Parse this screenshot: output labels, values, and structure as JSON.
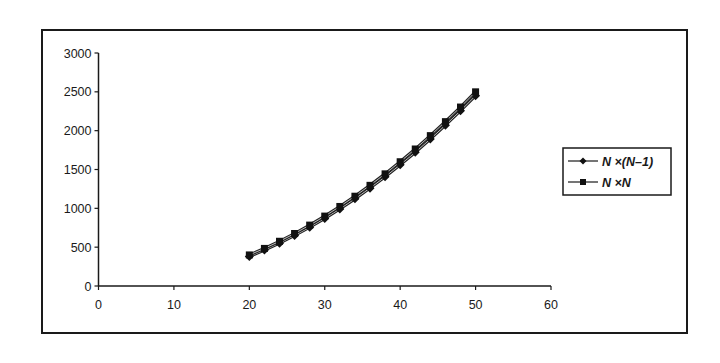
{
  "chart_data": {
    "type": "line",
    "title": "",
    "xlabel": "",
    "ylabel": "",
    "xlim": [
      0,
      60
    ],
    "ylim": [
      0,
      3000
    ],
    "x_ticks": [
      0,
      10,
      20,
      30,
      40,
      50,
      60
    ],
    "y_ticks": [
      0,
      500,
      1000,
      1500,
      2000,
      2500,
      3000
    ],
    "grid": false,
    "legend_position": "right",
    "x": [
      20,
      22,
      24,
      26,
      28,
      30,
      32,
      34,
      36,
      38,
      40,
      42,
      44,
      46,
      48,
      50
    ],
    "series": [
      {
        "name": "N ×(N–1)",
        "marker": "diamond",
        "values": [
          380,
          462,
          552,
          650,
          756,
          870,
          992,
          1122,
          1260,
          1406,
          1560,
          1722,
          1892,
          2070,
          2256,
          2450
        ]
      },
      {
        "name": "N ×N",
        "marker": "square",
        "values": [
          400,
          484,
          576,
          676,
          784,
          900,
          1024,
          1156,
          1296,
          1444,
          1600,
          1764,
          1936,
          2116,
          2304,
          2500
        ]
      }
    ]
  },
  "legend": {
    "items": [
      {
        "prefix": "N",
        "label": "N ×(N–1)"
      },
      {
        "prefix": "N",
        "label": "N ×N"
      }
    ]
  },
  "colors": {
    "line": "#555555",
    "marker": "#111111",
    "axis": "#1a1a1a"
  }
}
